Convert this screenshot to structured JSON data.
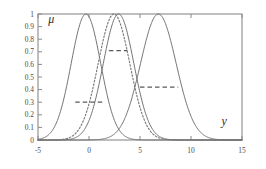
{
  "chart_data": {
    "type": "line",
    "title": "",
    "subtitle": "",
    "xlabel": "y",
    "ylabel": "μ",
    "xlim": [
      -5,
      15
    ],
    "ylim": [
      0,
      1
    ],
    "grid": false,
    "legend": "none",
    "x_ticks": [
      -5,
      0,
      5,
      10,
      15
    ],
    "x_tick_labels": [
      "-5",
      "0",
      "5",
      "10",
      "15"
    ],
    "y_ticks": [
      0,
      0.1,
      0.2,
      0.3,
      0.4,
      0.5,
      0.6,
      0.7,
      0.8,
      0.9,
      1
    ],
    "y_tick_labels": [
      "0",
      "0.1",
      "0.2",
      "0.3",
      "0.4",
      "0.5",
      "0.6",
      "0.7",
      "0.8",
      "0.9",
      "1"
    ],
    "series": [
      {
        "name": "membership-curve-1",
        "style": "solid",
        "peak_x": -0.3,
        "peak_y": 1,
        "sigma": 1.45,
        "color": "#6b6b6b"
      },
      {
        "name": "membership-curve-2",
        "style": "solid",
        "peak_x": 2.9,
        "peak_y": 1,
        "sigma": 1.5,
        "color": "#6b6b6b"
      },
      {
        "name": "membership-curve-3",
        "style": "solid",
        "peak_x": 6.8,
        "peak_y": 1,
        "sigma": 1.75,
        "color": "#6b6b6b"
      },
      {
        "name": "membership-curve-dotted",
        "style": "dotted",
        "peak_x": 2.45,
        "peak_y": 1,
        "sigma": 1.55,
        "color": "#7a7a7a"
      }
    ],
    "alpha_cuts": [
      {
        "name": "alpha-cut-1",
        "level": 0.3,
        "x_start": -1.35,
        "x_end": 1.45,
        "style": "dashed"
      },
      {
        "name": "alpha-cut-2",
        "level": 0.71,
        "x_start": 1.95,
        "x_end": 3.75,
        "style": "dashed"
      },
      {
        "name": "alpha-cut-3",
        "level": 0.42,
        "x_start": 5.0,
        "x_end": 8.75,
        "style": "dashed"
      }
    ],
    "annotations": [
      {
        "name": "mu-axis-symbol",
        "text": "μ",
        "x": -4.0,
        "y": 0.93
      },
      {
        "name": "y-axis-symbol",
        "text": "y",
        "x": 13.0,
        "y": 0.12
      }
    ]
  },
  "axis": {
    "x_title": "y",
    "y_title": "μ"
  },
  "colors": {
    "curve": "#6b6b6b",
    "dotted_curve": "#7a7a7a",
    "alpha_cut": "#5a5a5a",
    "frame": "#8a8a8a",
    "text": "#3f3f3f",
    "background": "#ffffff"
  }
}
